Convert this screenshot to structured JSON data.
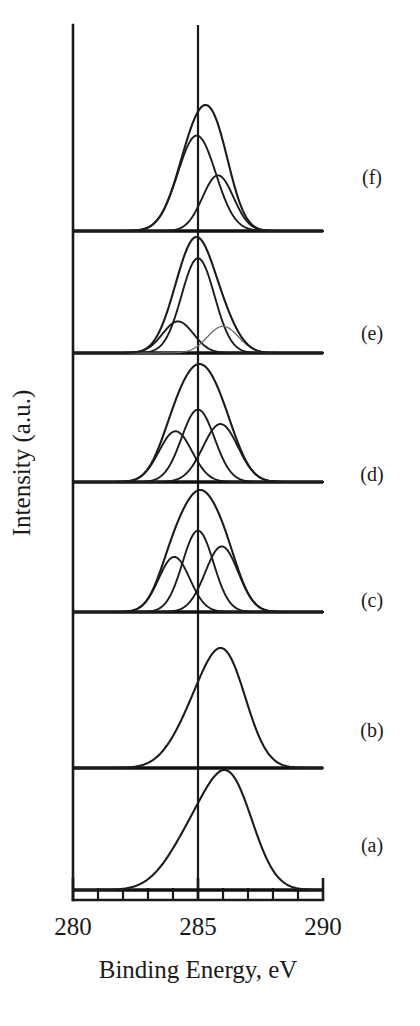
{
  "figure": {
    "kind": "xps-spectra-stack",
    "background_color": "#ffffff",
    "ink_color": "#1c1c1c",
    "faint_ink_color": "#6b6b6b"
  },
  "axes": {
    "x_title": "Binding Energy, eV",
    "y_title": "Intensity (a.u.)",
    "x_tick_labels": [
      "280",
      "285",
      "290"
    ],
    "x_labeled_ticks": [
      280,
      285,
      290
    ],
    "x_minor_ticks": [
      281,
      282,
      283,
      284,
      286,
      287,
      288,
      289
    ],
    "reference_line_value": 285
  },
  "trace_labels": [
    {
      "id": "a",
      "label": "(a)"
    },
    {
      "id": "b",
      "label": "(b)"
    },
    {
      "id": "c",
      "label": "(c)"
    },
    {
      "id": "d",
      "label": "(d)"
    },
    {
      "id": "e",
      "label": "(e)"
    },
    {
      "id": "f",
      "label": "(f)"
    }
  ],
  "chart_data": {
    "type": "line",
    "title": "",
    "xlabel": "Binding Energy, eV",
    "ylabel": "Intensity (a.u.)",
    "xlim": [
      280,
      290
    ],
    "x_inverted": false,
    "grid": false,
    "legend": "none",
    "stack_order_bottom_to_top": [
      "a",
      "b",
      "c",
      "d",
      "e",
      "f"
    ],
    "series": [
      {
        "name": "(a)",
        "id": "a",
        "role": "envelope",
        "peak_center": 286.3,
        "peak_amplitude": 1.0,
        "components": [
          {
            "center": 284.9,
            "amplitude": 0.58,
            "width": 1.05,
            "role": "shoulder"
          },
          {
            "center": 286.35,
            "amplitude": 1.0,
            "width": 0.92,
            "role": "main"
          }
        ]
      },
      {
        "name": "(b)",
        "id": "b",
        "role": "envelope",
        "peak_center": 286.1,
        "peak_amplitude": 1.0,
        "components": [
          {
            "center": 284.95,
            "amplitude": 0.5,
            "width": 0.92,
            "role": "shoulder"
          },
          {
            "center": 286.15,
            "amplitude": 1.0,
            "width": 0.85,
            "role": "main"
          }
        ]
      },
      {
        "name": "(c)",
        "id": "c",
        "role": "envelope-with-fit",
        "peak_center": 285.0,
        "peak_amplitude": 1.0,
        "components": [
          {
            "center": 284.05,
            "amplitude": 0.42,
            "width": 0.62,
            "role": "component"
          },
          {
            "center": 285.0,
            "amplitude": 0.62,
            "width": 0.62,
            "role": "component"
          },
          {
            "center": 285.95,
            "amplitude": 0.5,
            "width": 0.66,
            "role": "component"
          }
        ]
      },
      {
        "name": "(d)",
        "id": "d",
        "role": "envelope-with-fit",
        "peak_center": 285.0,
        "peak_amplitude": 1.0,
        "components": [
          {
            "center": 284.1,
            "amplitude": 0.42,
            "width": 0.66,
            "role": "component"
          },
          {
            "center": 285.0,
            "amplitude": 0.6,
            "width": 0.66,
            "role": "component"
          },
          {
            "center": 285.9,
            "amplitude": 0.48,
            "width": 0.7,
            "role": "component"
          }
        ]
      },
      {
        "name": "(e)",
        "id": "e",
        "role": "envelope-with-fit",
        "peak_center": 285.0,
        "peak_amplitude": 1.0,
        "components": [
          {
            "center": 284.2,
            "amplitude": 0.26,
            "width": 0.62,
            "role": "component"
          },
          {
            "center": 285.0,
            "amplitude": 0.78,
            "width": 0.66,
            "role": "main"
          },
          {
            "center": 286.0,
            "amplitude": 0.22,
            "width": 0.62,
            "role": "faint-component"
          }
        ]
      },
      {
        "name": "(f)",
        "id": "f",
        "role": "envelope-with-fit",
        "peak_center": 285.0,
        "peak_amplitude": 1.0,
        "components": [
          {
            "center": 284.95,
            "amplitude": 0.72,
            "width": 0.76,
            "role": "main"
          },
          {
            "center": 285.8,
            "amplitude": 0.42,
            "width": 0.62,
            "role": "component"
          }
        ]
      }
    ]
  },
  "layout": {
    "x_at_280": 73,
    "x_at_290": 323,
    "px_per_ev": 25,
    "axis_baseline_y": 900,
    "axis_top_y": 25,
    "tick_length_major": 22,
    "tick_length_minor": 12,
    "traces": [
      {
        "id": "a",
        "baseline_y": 890,
        "height_px": 120,
        "label_y": 852,
        "baseline_x_start": 73,
        "baseline_x_end": 323
      },
      {
        "id": "b",
        "baseline_y": 768,
        "height_px": 120,
        "label_y": 737,
        "baseline_x_start": 73,
        "baseline_x_end": 323
      },
      {
        "id": "c",
        "baseline_y": 612,
        "height_px": 122,
        "label_y": 607,
        "baseline_x_start": 73,
        "baseline_x_end": 323
      },
      {
        "id": "d",
        "baseline_y": 482,
        "height_px": 118,
        "label_y": 481,
        "baseline_x_start": 73,
        "baseline_x_end": 323
      },
      {
        "id": "e",
        "baseline_y": 353,
        "height_px": 116,
        "label_y": 340,
        "baseline_x_start": 73,
        "baseline_x_end": 323
      },
      {
        "id": "f",
        "baseline_y": 231,
        "height_px": 126,
        "label_y": 184,
        "baseline_x_start": 73,
        "baseline_x_end": 323
      }
    ],
    "label_x": 372,
    "x_tick_label_y": 935,
    "x_title_y": 978,
    "y_title_x": 30,
    "y_title_y": 463
  }
}
